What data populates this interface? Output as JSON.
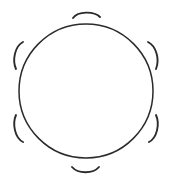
{
  "canvas": {
    "width": 171,
    "height": 186,
    "background_color": "#ffffff",
    "title": "Circle encircled by six outward-curving arcs"
  },
  "style": {
    "stroke_color": "#2b2b2b",
    "circle_stroke_width": 1.5,
    "arc_stroke_width": 1.9
  },
  "figure": {
    "main_circle": {
      "name": "main-circle",
      "center_x": 86,
      "center_y": 91,
      "radius": 67,
      "path": "M 86 24 C 123 24 153 54 153 91 C 153 128 123 158 86 158 C 49 158 19 128 19 91 C 19 54 49 24 86 24 Z"
    },
    "arcs": [
      {
        "name": "arc-top",
        "position_label": "top",
        "angle_degrees": 90,
        "path": "M 73 18 C 78 11 94 11 100 17"
      },
      {
        "name": "arc-upper-left",
        "position_label": "upper-left",
        "angle_degrees": 150,
        "path": "M 23 42 C 15 46 12 60 16 69"
      },
      {
        "name": "arc-upper-right",
        "position_label": "upper-right",
        "angle_degrees": 30,
        "path": "M 148 42 C 156 46 160 59 156 69"
      },
      {
        "name": "arc-lower-left",
        "position_label": "lower-left",
        "angle_degrees": 210,
        "path": "M 16 115 C 12 124 15 138 23 142"
      },
      {
        "name": "arc-lower-right",
        "position_label": "lower-right",
        "angle_degrees": 330,
        "path": "M 156 115 C 160 124 157 138 149 142"
      },
      {
        "name": "arc-bottom",
        "position_label": "bottom",
        "angle_degrees": 270,
        "path": "M 72 167 C 78 174 93 174 99 167"
      }
    ]
  }
}
